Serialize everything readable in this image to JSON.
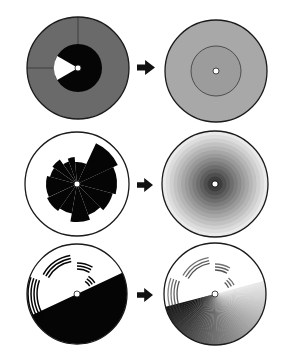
{
  "canvas": {
    "width": 291,
    "height": 359,
    "background": "#ffffff"
  },
  "colors": {
    "outline": "#1a1a1a",
    "black": "#050505",
    "white": "#ffffff",
    "dark_gray": "#6a6a6a",
    "mid_gray": "#a8a8a8",
    "inner_gray": "#9c9c9c",
    "arrow": "#111111"
  },
  "rows": [
    {
      "id": "row-1",
      "before": {
        "name": "sectored-disk-before",
        "cx": 78,
        "cy": 68,
        "r": 51,
        "outer_fill": "#6a6a6a",
        "outer_divider_angles_deg": [
          0,
          270
        ],
        "inner_r": 24,
        "inner_fill": "#050505",
        "white_wedge": {
          "start_deg": 240,
          "end_deg": 300,
          "r": 24,
          "fill": "#ffffff"
        },
        "hub_r": 3
      },
      "arrow": {
        "x": 137,
        "y": 60,
        "w": 18,
        "h": 15
      },
      "after": {
        "name": "uniform-disk-after",
        "cx": 216,
        "cy": 71,
        "r": 51,
        "fill": "#a8a8a8",
        "inner_ring_r": 25,
        "inner_fill": "#9c9c9c",
        "hub_r": 3
      }
    },
    {
      "id": "row-2",
      "before": {
        "name": "polar-rose-disk-before",
        "cx": 77,
        "cy": 184,
        "r": 52,
        "fill": "#ffffff",
        "hub_r": 3,
        "sectors": [
          {
            "start_deg": 25,
            "end_deg": 65,
            "r": 45
          },
          {
            "start_deg": 65,
            "end_deg": 105,
            "r": 40
          },
          {
            "start_deg": 105,
            "end_deg": 135,
            "r": 37
          },
          {
            "start_deg": 135,
            "end_deg": 160,
            "r": 33
          },
          {
            "start_deg": 160,
            "end_deg": 190,
            "r": 38
          },
          {
            "start_deg": 190,
            "end_deg": 215,
            "r": 30
          },
          {
            "start_deg": 215,
            "end_deg": 245,
            "r": 33
          },
          {
            "start_deg": 245,
            "end_deg": 285,
            "r": 31
          },
          {
            "start_deg": 285,
            "end_deg": 305,
            "r": 28
          },
          {
            "start_deg": 305,
            "end_deg": 325,
            "r": 30
          },
          {
            "start_deg": 325,
            "end_deg": 340,
            "r": 24
          },
          {
            "start_deg": 340,
            "end_deg": 355,
            "r": 27
          },
          {
            "start_deg": 355,
            "end_deg": 385,
            "r": 22
          }
        ]
      },
      "arrow": {
        "x": 137,
        "y": 178,
        "w": 16,
        "h": 14
      },
      "after": {
        "name": "radial-gradient-disk-after",
        "cx": 215,
        "cy": 184,
        "r": 53,
        "bands": 14,
        "center_color": "#1e1e1e",
        "edge_color": "#f0f0f0",
        "hub_r": 3
      }
    },
    {
      "id": "row-3",
      "before": {
        "name": "half-black-ring-arcs-before",
        "cx": 77,
        "cy": 294,
        "r": 50,
        "split_angle_deg": 65,
        "lower_fill": "#050505",
        "upper_fill": "#ffffff",
        "hub_r": 3,
        "arc_groups": [
          {
            "start_deg": 235,
            "end_deg": 290,
            "radii": [
              40,
              43,
              46,
              49
            ]
          },
          {
            "start_deg": 300,
            "end_deg": 350,
            "radii": [
              33,
              36,
              39
            ]
          },
          {
            "start_deg": 0,
            "end_deg": 30,
            "radii": [
              25,
              28,
              31
            ]
          },
          {
            "start_deg": 33,
            "end_deg": 58,
            "radii": [
              15,
              18,
              21
            ]
          }
        ]
      },
      "arrow": {
        "x": 137,
        "y": 288,
        "w": 16,
        "h": 14
      },
      "after": {
        "name": "angular-gradient-disk-after",
        "cx": 215,
        "cy": 294,
        "r": 51,
        "split_angle_deg": 75,
        "gradient_dark": "#1a1a1a",
        "gradient_light": "#e8e8e8",
        "hub_r": 3,
        "arc_groups": [
          {
            "start_deg": 235,
            "end_deg": 290,
            "radii": [
              38,
              41,
              44,
              47
            ]
          },
          {
            "start_deg": 300,
            "end_deg": 350,
            "radii": [
              31,
              34,
              37
            ]
          },
          {
            "start_deg": 0,
            "end_deg": 30,
            "radii": [
              24,
              27,
              30
            ]
          },
          {
            "start_deg": 40,
            "end_deg": 65,
            "radii": [
              15,
              18,
              21
            ]
          }
        ]
      }
    }
  ]
}
